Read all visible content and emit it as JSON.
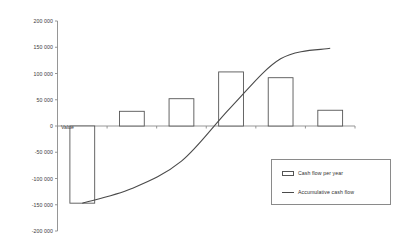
{
  "chart_data": {
    "type": "bar",
    "title": "",
    "subtitle": "",
    "xlabel": "",
    "ylabel": "",
    "grid": false,
    "legend_position": "bottom-right",
    "ylim": [
      -200000,
      200000
    ],
    "ytick_labels": [
      "200 000",
      "150 000",
      "100 000",
      "50 000",
      "0",
      "-50 000",
      "-100 000",
      "-150 000",
      "-200 000"
    ],
    "ytick_values": [
      200000,
      150000,
      100000,
      50000,
      0,
      -50000,
      -100000,
      -150000,
      -200000
    ],
    "categories": [
      "1",
      "2",
      "3",
      "4",
      "5",
      "6"
    ],
    "xtick_labels": [
      "",
      "",
      "",
      "",
      "",
      ""
    ],
    "annotations": [
      {
        "text": "Value",
        "series": "Cash flow per year",
        "category": "1"
      }
    ],
    "series": [
      {
        "name": "Cash flow per year",
        "type": "bar",
        "values": [
          -147000,
          28000,
          52000,
          103000,
          92000,
          30000
        ]
      },
      {
        "name": "Accumulative cash flow",
        "type": "line",
        "values": [
          -147000,
          -119000,
          -67000,
          36000,
          128000,
          148000
        ]
      }
    ]
  },
  "legend": {
    "items": [
      {
        "label": "Cash flow per year",
        "marker": "bar-swatch-icon"
      },
      {
        "label": "Accumulative cash flow",
        "marker": "line-swatch-icon"
      }
    ]
  },
  "colors": {
    "axis": "#8a8a8a",
    "bar_stroke": "#555555",
    "line": "#4a4a4a",
    "text": "#2f2f2f",
    "background": "#ffffff"
  }
}
